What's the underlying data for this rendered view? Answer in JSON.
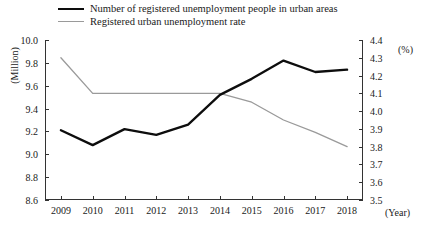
{
  "legend": {
    "position": "top-left",
    "entries": [
      {
        "label": "Number of registered unemployment people in urban areas",
        "color": "#0d0d0d",
        "style": "thick"
      },
      {
        "label": "Registered urban unemployment rate",
        "color": "#9a9a9a",
        "style": "thin"
      }
    ]
  },
  "axes": {
    "left_unit": "(Million)",
    "right_unit": "(%)",
    "x_unit": "(Year)"
  },
  "chart_data": {
    "type": "line",
    "title": "",
    "xlabel": "(Year)",
    "ylabel": "(Million)",
    "y2label": "(%)",
    "grid": false,
    "legend_position": "top-left",
    "x": [
      "2009",
      "2010",
      "2011",
      "2012",
      "2013",
      "2014",
      "2015",
      "2016",
      "2017",
      "2018"
    ],
    "categories": [
      "2009",
      "2010",
      "2011",
      "2012",
      "2013",
      "2014",
      "2015",
      "2016",
      "2017",
      "2018"
    ],
    "ylim": [
      8.6,
      10.0
    ],
    "ytick_step": 0.2,
    "yticks": [
      "10.0",
      "9.8",
      "9.6",
      "9.4",
      "9.2",
      "9.0",
      "8.8",
      "8.6"
    ],
    "y2lim": [
      3.5,
      4.4
    ],
    "y2tick_step": 0.1,
    "y2ticks": [
      "4.4",
      "4.3",
      "4.2",
      "4.1",
      "4.0",
      "3.9",
      "3.8",
      "3.7",
      "3.6",
      "3.5"
    ],
    "series": [
      {
        "name": "Number of registered unemployment people in urban areas",
        "axis": "left",
        "unit": "Million",
        "color": "#0d0d0d",
        "values": [
          9.21,
          9.08,
          9.22,
          9.17,
          9.26,
          9.52,
          9.66,
          9.82,
          9.72,
          9.74
        ]
      },
      {
        "name": "Registered urban unemployment rate",
        "axis": "right",
        "unit": "%",
        "color": "#9a9a9a",
        "values": [
          4.3,
          4.1,
          4.1,
          4.1,
          4.1,
          4.1,
          4.05,
          3.95,
          3.88,
          3.8
        ]
      }
    ]
  }
}
